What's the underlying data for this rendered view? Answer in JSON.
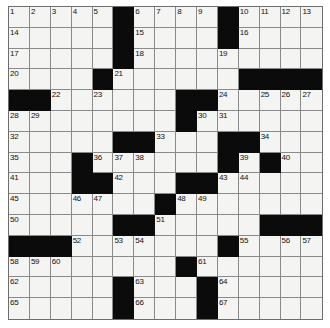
{
  "puzzle": {
    "title": "Crossword Grid",
    "rows": 15,
    "cols": 15,
    "colors": {
      "block": "#0b0b0b",
      "cell": "#f4f4f2",
      "grid_line": "#8a8a8a",
      "number_text": "#111111",
      "page_background": "#ffffff"
    },
    "blocks": [
      [
        0,
        5
      ],
      [
        0,
        10
      ],
      [
        1,
        5
      ],
      [
        1,
        10
      ],
      [
        2,
        5
      ],
      [
        3,
        4
      ],
      [
        3,
        11
      ],
      [
        3,
        12
      ],
      [
        3,
        13
      ],
      [
        3,
        14
      ],
      [
        4,
        0
      ],
      [
        4,
        1
      ],
      [
        4,
        8
      ],
      [
        4,
        9
      ],
      [
        5,
        8
      ],
      [
        6,
        5
      ],
      [
        6,
        6
      ],
      [
        6,
        10
      ],
      [
        6,
        11
      ],
      [
        7,
        3
      ],
      [
        7,
        10
      ],
      [
        7,
        12
      ],
      [
        8,
        3
      ],
      [
        8,
        4
      ],
      [
        8,
        8
      ],
      [
        8,
        9
      ],
      [
        9,
        7
      ],
      [
        10,
        5
      ],
      [
        10,
        6
      ],
      [
        10,
        12
      ],
      [
        10,
        13
      ],
      [
        10,
        14
      ],
      [
        11,
        0
      ],
      [
        11,
        1
      ],
      [
        11,
        2
      ],
      [
        11,
        10
      ],
      [
        12,
        8
      ],
      [
        13,
        5
      ],
      [
        13,
        9
      ],
      [
        14,
        5
      ],
      [
        14,
        9
      ]
    ],
    "numbers": [
      {
        "row": 0,
        "col": 0,
        "n": "1"
      },
      {
        "row": 0,
        "col": 1,
        "n": "2"
      },
      {
        "row": 0,
        "col": 2,
        "n": "3"
      },
      {
        "row": 0,
        "col": 3,
        "n": "4"
      },
      {
        "row": 0,
        "col": 4,
        "n": "5"
      },
      {
        "row": 0,
        "col": 6,
        "n": "6"
      },
      {
        "row": 0,
        "col": 7,
        "n": "7"
      },
      {
        "row": 0,
        "col": 8,
        "n": "8"
      },
      {
        "row": 0,
        "col": 9,
        "n": "9"
      },
      {
        "row": 0,
        "col": 11,
        "n": "10"
      },
      {
        "row": 0,
        "col": 12,
        "n": "11"
      },
      {
        "row": 0,
        "col": 13,
        "n": "12"
      },
      {
        "row": 0,
        "col": 14,
        "n": "13"
      },
      {
        "row": 1,
        "col": 0,
        "n": "14"
      },
      {
        "row": 1,
        "col": 6,
        "n": "15"
      },
      {
        "row": 1,
        "col": 11,
        "n": "16"
      },
      {
        "row": 2,
        "col": 0,
        "n": "17"
      },
      {
        "row": 2,
        "col": 6,
        "n": "18"
      },
      {
        "row": 2,
        "col": 10,
        "n": "19"
      },
      {
        "row": 3,
        "col": 0,
        "n": "20"
      },
      {
        "row": 3,
        "col": 5,
        "n": "21"
      },
      {
        "row": 4,
        "col": 2,
        "n": "22"
      },
      {
        "row": 4,
        "col": 4,
        "n": "23"
      },
      {
        "row": 4,
        "col": 10,
        "n": "24"
      },
      {
        "row": 4,
        "col": 12,
        "n": "25"
      },
      {
        "row": 4,
        "col": 13,
        "n": "26"
      },
      {
        "row": 4,
        "col": 14,
        "n": "27"
      },
      {
        "row": 5,
        "col": 0,
        "n": "28"
      },
      {
        "row": 5,
        "col": 1,
        "n": "29"
      },
      {
        "row": 5,
        "col": 9,
        "n": "30"
      },
      {
        "row": 5,
        "col": 10,
        "n": "31"
      },
      {
        "row": 6,
        "col": 0,
        "n": "32"
      },
      {
        "row": 6,
        "col": 7,
        "n": "33"
      },
      {
        "row": 6,
        "col": 12,
        "n": "34"
      },
      {
        "row": 7,
        "col": 0,
        "n": "35"
      },
      {
        "row": 7,
        "col": 4,
        "n": "36"
      },
      {
        "row": 7,
        "col": 5,
        "n": "37"
      },
      {
        "row": 7,
        "col": 6,
        "n": "38"
      },
      {
        "row": 7,
        "col": 11,
        "n": "39"
      },
      {
        "row": 7,
        "col": 13,
        "n": "40"
      },
      {
        "row": 8,
        "col": 0,
        "n": "41"
      },
      {
        "row": 8,
        "col": 5,
        "n": "42"
      },
      {
        "row": 8,
        "col": 10,
        "n": "43"
      },
      {
        "row": 8,
        "col": 11,
        "n": "44"
      },
      {
        "row": 9,
        "col": 0,
        "n": "45"
      },
      {
        "row": 9,
        "col": 3,
        "n": "46"
      },
      {
        "row": 9,
        "col": 4,
        "n": "47"
      },
      {
        "row": 9,
        "col": 8,
        "n": "48"
      },
      {
        "row": 9,
        "col": 9,
        "n": "49"
      },
      {
        "row": 10,
        "col": 0,
        "n": "50"
      },
      {
        "row": 10,
        "col": 7,
        "n": "51"
      },
      {
        "row": 11,
        "col": 3,
        "n": "52"
      },
      {
        "row": 11,
        "col": 5,
        "n": "53"
      },
      {
        "row": 11,
        "col": 6,
        "n": "54"
      },
      {
        "row": 11,
        "col": 11,
        "n": "55"
      },
      {
        "row": 11,
        "col": 13,
        "n": "56"
      },
      {
        "row": 11,
        "col": 14,
        "n": "57"
      },
      {
        "row": 12,
        "col": 0,
        "n": "58"
      },
      {
        "row": 12,
        "col": 1,
        "n": "59"
      },
      {
        "row": 12,
        "col": 2,
        "n": "60"
      },
      {
        "row": 12,
        "col": 9,
        "n": "61"
      },
      {
        "row": 13,
        "col": 0,
        "n": "62"
      },
      {
        "row": 13,
        "col": 6,
        "n": "63"
      },
      {
        "row": 13,
        "col": 10,
        "n": "64"
      },
      {
        "row": 14,
        "col": 0,
        "n": "65"
      },
      {
        "row": 14,
        "col": 6,
        "n": "66"
      },
      {
        "row": 14,
        "col": 10,
        "n": "67"
      }
    ]
  }
}
